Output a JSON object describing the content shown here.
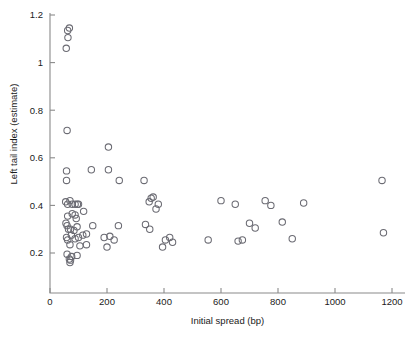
{
  "chart_data": {
    "type": "scatter",
    "title": "",
    "xlabel": "Initial spread (bp)",
    "ylabel": "Left tail index (estimate)",
    "xlim": [
      0,
      1245
    ],
    "ylim": [
      0.125,
      1.215
    ],
    "grid": false,
    "legend": null,
    "xticks": [
      0,
      200,
      400,
      600,
      800,
      1000,
      1200
    ],
    "xtick_labels": [
      "0",
      "200",
      "400",
      "600",
      "800",
      "1000",
      "1200"
    ],
    "yticks": [
      0.2,
      0.4,
      0.6,
      0.8,
      1.0,
      1.2
    ],
    "ytick_labels": [
      "0.2",
      "0.4",
      "0.6",
      "0.8",
      "1",
      "1.2"
    ],
    "marker": {
      "shape": "open-circle",
      "radius_px": 3.2,
      "edge_color": "#6b6b73",
      "fill": "none"
    },
    "axis_color": "#8a8a8a",
    "points": [
      [
        62,
        1.135
      ],
      [
        68,
        1.145
      ],
      [
        63,
        1.105
      ],
      [
        57,
        1.06
      ],
      [
        60,
        0.715
      ],
      [
        205,
        0.645
      ],
      [
        58,
        0.545
      ],
      [
        145,
        0.55
      ],
      [
        205,
        0.55
      ],
      [
        243,
        0.505
      ],
      [
        58,
        0.505
      ],
      [
        330,
        0.505
      ],
      [
        55,
        0.415
      ],
      [
        62,
        0.405
      ],
      [
        70,
        0.42
      ],
      [
        78,
        0.405
      ],
      [
        88,
        0.405
      ],
      [
        96,
        0.405
      ],
      [
        100,
        0.405
      ],
      [
        355,
        0.43
      ],
      [
        362,
        0.435
      ],
      [
        348,
        0.415
      ],
      [
        380,
        0.405
      ],
      [
        372,
        0.385
      ],
      [
        62,
        0.355
      ],
      [
        78,
        0.365
      ],
      [
        88,
        0.36
      ],
      [
        92,
        0.345
      ],
      [
        118,
        0.375
      ],
      [
        600,
        0.42
      ],
      [
        650,
        0.405
      ],
      [
        755,
        0.42
      ],
      [
        775,
        0.4
      ],
      [
        890,
        0.41
      ],
      [
        1165,
        0.505
      ],
      [
        56,
        0.325
      ],
      [
        60,
        0.315
      ],
      [
        65,
        0.3
      ],
      [
        72,
        0.3
      ],
      [
        84,
        0.295
      ],
      [
        95,
        0.31
      ],
      [
        150,
        0.315
      ],
      [
        240,
        0.315
      ],
      [
        335,
        0.32
      ],
      [
        350,
        0.3
      ],
      [
        700,
        0.325
      ],
      [
        720,
        0.305
      ],
      [
        815,
        0.33
      ],
      [
        58,
        0.265
      ],
      [
        62,
        0.255
      ],
      [
        75,
        0.275
      ],
      [
        88,
        0.26
      ],
      [
        100,
        0.265
      ],
      [
        115,
        0.275
      ],
      [
        128,
        0.28
      ],
      [
        190,
        0.265
      ],
      [
        210,
        0.27
      ],
      [
        225,
        0.255
      ],
      [
        405,
        0.255
      ],
      [
        420,
        0.265
      ],
      [
        430,
        0.245
      ],
      [
        555,
        0.255
      ],
      [
        660,
        0.25
      ],
      [
        675,
        0.255
      ],
      [
        850,
        0.26
      ],
      [
        1170,
        0.285
      ],
      [
        70,
        0.235
      ],
      [
        105,
        0.23
      ],
      [
        128,
        0.235
      ],
      [
        200,
        0.225
      ],
      [
        395,
        0.225
      ],
      [
        60,
        0.195
      ],
      [
        68,
        0.175
      ],
      [
        72,
        0.17
      ],
      [
        70,
        0.16
      ],
      [
        76,
        0.185
      ],
      [
        95,
        0.19
      ]
    ]
  }
}
